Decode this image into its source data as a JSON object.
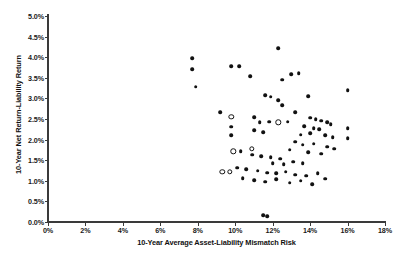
{
  "chart_data": {
    "type": "scatter",
    "title": "",
    "xlabel": "10-Year Average Asset-Liability Mismatch Risk",
    "ylabel": "10-Year Net Return-Liability Return",
    "xlim": [
      0,
      18
    ],
    "ylim": [
      0,
      5
    ],
    "xticks": [
      "0%",
      "2%",
      "4%",
      "6%",
      "8%",
      "10%",
      "12%",
      "14%",
      "16%",
      "18%"
    ],
    "xtick_values": [
      0,
      2,
      4,
      6,
      8,
      10,
      12,
      14,
      16,
      18
    ],
    "yticks": [
      "0.0%",
      "0.5%",
      "1.0%",
      "1.5%",
      "2.0%",
      "2.5%",
      "3.0%",
      "3.5%",
      "4.0%",
      "4.5%",
      "5.0%"
    ],
    "ytick_values": [
      0.0,
      0.5,
      1.0,
      1.5,
      2.0,
      2.5,
      3.0,
      3.5,
      4.0,
      4.5,
      5.0
    ],
    "grid": false,
    "legend": false,
    "marker_color": "#111111",
    "axis_color": "#3a3a3a",
    "series": [
      {
        "name": "Filled markers",
        "marker": "filled-circle",
        "points": [
          [
            7.7,
            3.98
          ],
          [
            10.2,
            3.78
          ],
          [
            7.7,
            3.71
          ],
          [
            7.9,
            3.28
          ],
          [
            9.2,
            2.67
          ],
          [
            9.8,
            2.31
          ],
          [
            9.8,
            2.1
          ],
          [
            12.3,
            4.22
          ],
          [
            9.8,
            3.78
          ],
          [
            10.8,
            3.54
          ],
          [
            13.0,
            3.59
          ],
          [
            13.4,
            3.61
          ],
          [
            12.5,
            3.45
          ],
          [
            11.6,
            3.08
          ],
          [
            11.9,
            3.04
          ],
          [
            12.3,
            2.96
          ],
          [
            13.9,
            3.06
          ],
          [
            12.5,
            2.84
          ],
          [
            13.2,
            2.67
          ],
          [
            16.0,
            3.2
          ],
          [
            11.0,
            2.55
          ],
          [
            11.3,
            2.42
          ],
          [
            11.8,
            2.43
          ],
          [
            11.0,
            2.23
          ],
          [
            11.5,
            2.18
          ],
          [
            12.8,
            2.43
          ],
          [
            14.0,
            2.53
          ],
          [
            14.3,
            2.49
          ],
          [
            14.6,
            2.46
          ],
          [
            14.9,
            2.42
          ],
          [
            15.1,
            2.38
          ],
          [
            13.7,
            2.33
          ],
          [
            14.2,
            2.28
          ],
          [
            14.5,
            2.25
          ],
          [
            14.0,
            2.15
          ],
          [
            13.5,
            2.12
          ],
          [
            14.8,
            2.1
          ],
          [
            15.2,
            2.06
          ],
          [
            16.0,
            2.28
          ],
          [
            16.0,
            2.03
          ],
          [
            13.2,
            1.95
          ],
          [
            13.6,
            1.88
          ],
          [
            14.2,
            1.9
          ],
          [
            14.9,
            1.83
          ],
          [
            15.3,
            1.78
          ],
          [
            12.9,
            1.75
          ],
          [
            13.9,
            1.7
          ],
          [
            14.6,
            1.66
          ],
          [
            10.3,
            1.72
          ],
          [
            10.9,
            1.63
          ],
          [
            11.4,
            1.6
          ],
          [
            11.9,
            1.57
          ],
          [
            12.4,
            1.54
          ],
          [
            12.0,
            1.43
          ],
          [
            12.6,
            1.4
          ],
          [
            13.1,
            1.46
          ],
          [
            13.6,
            1.42
          ],
          [
            10.1,
            1.32
          ],
          [
            10.6,
            1.28
          ],
          [
            11.2,
            1.25
          ],
          [
            11.7,
            1.2
          ],
          [
            12.2,
            1.18
          ],
          [
            12.7,
            1.22
          ],
          [
            13.2,
            1.15
          ],
          [
            13.8,
            1.12
          ],
          [
            14.4,
            1.18
          ],
          [
            10.4,
            1.06
          ],
          [
            11.0,
            1.02
          ],
          [
            11.6,
            0.98
          ],
          [
            12.2,
            1.04
          ],
          [
            12.9,
            0.95
          ],
          [
            13.5,
            1.0
          ],
          [
            14.1,
            0.92
          ],
          [
            14.8,
            1.05
          ],
          [
            11.5,
            0.17
          ],
          [
            11.7,
            0.14
          ]
        ]
      },
      {
        "name": "Open markers",
        "marker": "open-circle",
        "points": [
          [
            9.8,
            2.55
          ],
          [
            12.3,
            2.42
          ],
          [
            9.9,
            1.72
          ],
          [
            10.9,
            1.78
          ],
          [
            9.3,
            1.22
          ],
          [
            9.7,
            1.22
          ]
        ]
      }
    ]
  }
}
